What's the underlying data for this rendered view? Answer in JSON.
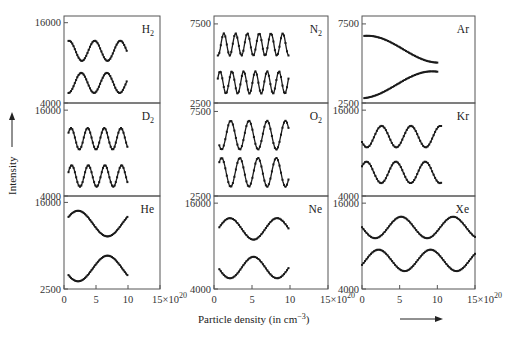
{
  "chart_data": {
    "type": "scatter",
    "title": "",
    "xlabel": "Particle density (in cm⁻³)",
    "ylabel": "Intensity",
    "x_tick_labels": [
      "0",
      "5",
      "10",
      "15×10²⁰"
    ],
    "x_ticks": [
      0,
      5,
      10,
      15
    ],
    "xlim": [
      0,
      15
    ],
    "x_unit_exponent": "20",
    "grid": false,
    "legend": null,
    "layout": {
      "rows": 3,
      "cols": 3
    },
    "panels": [
      {
        "gas": "H₂",
        "label_main": "H",
        "label_sub": "2",
        "row": 0,
        "col": 0,
        "ylim": [
          4000,
          17000
        ],
        "y_ticks": [
          4000,
          16000
        ],
        "x_range": [
          0.7,
          9.9
        ],
        "series": [
          {
            "name": "upper",
            "mean": 11800,
            "amplitude": 1500,
            "period": 4.0,
            "phase_x_max": 0.8,
            "x_start": 0.7,
            "x_end": 9.8
          },
          {
            "name": "lower",
            "mean": 7000,
            "amplitude": 1500,
            "period": 4.0,
            "phase_x_max": 2.7,
            "x_start": 0.7,
            "x_end": 9.8
          }
        ]
      },
      {
        "gas": "N₂",
        "label_main": "N",
        "label_sub": "2",
        "row": 0,
        "col": 1,
        "ylim": [
          2500,
          8000
        ],
        "y_ticks": [
          2500,
          7500
        ],
        "x_range": [
          0.5,
          9.8
        ],
        "series": [
          {
            "name": "upper",
            "mean": 6200,
            "amplitude": 700,
            "period": 1.55,
            "phase_x_max": 1.3,
            "x_start": 0.5,
            "x_end": 9.8
          },
          {
            "name": "lower",
            "mean": 3800,
            "amplitude": 700,
            "period": 1.55,
            "phase_x_max": 0.8,
            "x_start": 0.5,
            "x_end": 9.8
          }
        ]
      },
      {
        "gas": "Ar",
        "label_main": "Ar",
        "label_sub": "",
        "row": 0,
        "col": 2,
        "ylim": [
          2500,
          8000
        ],
        "y_ticks": [
          2500,
          7500
        ],
        "x_range": [
          0.3,
          10
        ],
        "series": [
          {
            "name": "upper",
            "mean": 5900,
            "amplitude": 850,
            "period": 19,
            "phase_x_max": 0.7,
            "x_start": 0.3,
            "x_end": 10
          },
          {
            "name": "lower",
            "mean": 3650,
            "amplitude": 850,
            "period": 19,
            "phase_x_max": 9.3,
            "x_start": 0.3,
            "x_end": 10
          }
        ]
      },
      {
        "gas": "D₂",
        "label_main": "D",
        "label_sub": "2",
        "row": 1,
        "col": 0,
        "ylim": [
          4000,
          17000
        ],
        "y_ticks": [
          4000,
          16000
        ],
        "x_range": [
          0.7,
          9.9
        ],
        "series": [
          {
            "name": "upper",
            "mean": 12000,
            "amplitude": 1500,
            "period": 2.6,
            "phase_x_max": 1.1,
            "x_start": 0.7,
            "x_end": 9.9
          },
          {
            "name": "lower",
            "mean": 6800,
            "amplitude": 1500,
            "period": 2.6,
            "phase_x_max": 1.2,
            "x_start": 0.7,
            "x_end": 9.9
          }
        ]
      },
      {
        "gas": "O₂",
        "label_main": "O",
        "label_sub": "2",
        "row": 1,
        "col": 1,
        "ylim": [
          2500,
          8000
        ],
        "y_ticks": [
          2500,
          7500
        ],
        "x_range": [
          0.7,
          9.8
        ],
        "series": [
          {
            "name": "upper",
            "mean": 6100,
            "amplitude": 850,
            "period": 2.4,
            "phase_x_max": 2.2,
            "x_start": 0.7,
            "x_end": 9.8
          },
          {
            "name": "lower",
            "mean": 3900,
            "amplitude": 850,
            "period": 2.4,
            "phase_x_max": 1.0,
            "x_start": 0.7,
            "x_end": 9.8
          }
        ]
      },
      {
        "gas": "Kr",
        "label_main": "Kr",
        "label_sub": "",
        "row": 1,
        "col": 2,
        "ylim": [
          4000,
          17000
        ],
        "y_ticks": [
          4000,
          16000
        ],
        "x_range": [
          0,
          10.5
        ],
        "series": [
          {
            "name": "upper",
            "mean": 12300,
            "amplitude": 1500,
            "period": 3.9,
            "phase_x_max": 2.6,
            "x_start": 0,
            "x_end": 10.5
          },
          {
            "name": "lower",
            "mean": 7300,
            "amplitude": 1500,
            "period": 3.9,
            "phase_x_max": 0.6,
            "x_start": 0,
            "x_end": 10.5
          }
        ]
      },
      {
        "gas": "He",
        "label_main": "He",
        "label_sub": "",
        "row": 2,
        "col": 0,
        "ylim": [
          2500,
          17000
        ],
        "y_ticks": [
          2500,
          16000
        ],
        "x_range": [
          0.7,
          9.9
        ],
        "series": [
          {
            "name": "upper",
            "mean": 12700,
            "amplitude": 2000,
            "period": 9.2,
            "phase_x_max": 2.2,
            "x_start": 0.7,
            "x_end": 9.9
          },
          {
            "name": "lower",
            "mean": 5700,
            "amplitude": 2000,
            "period": 9.2,
            "phase_x_max": 6.8,
            "x_start": 0.7,
            "x_end": 9.9
          }
        ]
      },
      {
        "gas": "Ne",
        "label_main": "Ne",
        "label_sub": "",
        "row": 2,
        "col": 1,
        "ylim": [
          4000,
          17000
        ],
        "y_ticks": [
          4000,
          16000
        ],
        "x_range": [
          0.7,
          9.8
        ],
        "series": [
          {
            "name": "upper",
            "mean": 12400,
            "amplitude": 1500,
            "period": 6.2,
            "phase_x_max": 2.1,
            "x_start": 0.7,
            "x_end": 9.8
          },
          {
            "name": "lower",
            "mean": 7000,
            "amplitude": 1500,
            "period": 6.2,
            "phase_x_max": 5.2,
            "x_start": 0.7,
            "x_end": 9.8
          }
        ]
      },
      {
        "gas": "Xe",
        "label_main": "Xe",
        "label_sub": "",
        "row": 2,
        "col": 2,
        "ylim": [
          4000,
          17000
        ],
        "y_ticks": [
          4000,
          16000
        ],
        "x_range": [
          0,
          15
        ],
        "series": [
          {
            "name": "upper",
            "mean": 12600,
            "amplitude": 1500,
            "period": 6.9,
            "phase_x_max": 5.2,
            "x_start": 0,
            "x_end": 15
          },
          {
            "name": "lower",
            "mean": 8000,
            "amplitude": 1500,
            "period": 6.9,
            "phase_x_max": 2.2,
            "x_start": 0,
            "x_end": 15
          }
        ]
      }
    ]
  },
  "layout": {
    "col_x": [
      [
        64,
        160
      ],
      [
        214,
        328
      ],
      [
        362,
        475
      ]
    ],
    "row_y": [
      [
        16,
        103
      ],
      [
        103,
        196
      ],
      [
        196,
        289
      ]
    ],
    "line_color": "#1a1a1a",
    "frame_color": "#555555"
  }
}
